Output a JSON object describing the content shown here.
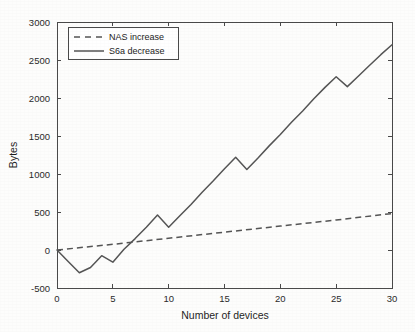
{
  "chart_data": {
    "type": "line",
    "title": "",
    "xlabel": "Number of devices",
    "ylabel": "Bytes",
    "xlim": [
      0,
      30
    ],
    "ylim": [
      -500,
      3000
    ],
    "xticks": [
      0,
      5,
      10,
      15,
      20,
      25,
      30
    ],
    "yticks": [
      -500,
      0,
      500,
      1000,
      1500,
      2000,
      2500,
      3000
    ],
    "xtick_labels": [
      "0",
      "5",
      "10",
      "15",
      "20",
      "25",
      "30"
    ],
    "ytick_labels": [
      "-500",
      "0",
      "500",
      "1000",
      "1500",
      "2000",
      "2500",
      "3000"
    ],
    "grid": false,
    "legend_position": "top-left",
    "series": [
      {
        "name": "NAS increase",
        "style": "dashed",
        "color": "#555555",
        "x": [
          0,
          5,
          10,
          15,
          20,
          25,
          30
        ],
        "values": [
          0,
          75,
          155,
          235,
          315,
          395,
          480
        ]
      },
      {
        "name": "S6a decrease",
        "style": "solid",
        "color": "#555555",
        "x": [
          0,
          1,
          2,
          3,
          4,
          5,
          6,
          7,
          8,
          9,
          10,
          11,
          12,
          13,
          14,
          15,
          16,
          17,
          18,
          19,
          20,
          21,
          22,
          23,
          24,
          25,
          26,
          27,
          28,
          29,
          30
        ],
        "values": [
          0,
          -150,
          -300,
          -230,
          -75,
          -160,
          10,
          150,
          300,
          460,
          300,
          450,
          600,
          760,
          910,
          1070,
          1220,
          1060,
          1210,
          1370,
          1520,
          1680,
          1830,
          1990,
          2140,
          2280,
          2150,
          2290,
          2430,
          2570,
          2700
        ]
      }
    ]
  },
  "legend": {
    "entries": [
      {
        "label": "NAS increase",
        "style": "dashed"
      },
      {
        "label": "S6a decrease",
        "style": "solid"
      }
    ]
  },
  "axes": {
    "x_title": "Number of devices",
    "y_title": "Bytes"
  }
}
